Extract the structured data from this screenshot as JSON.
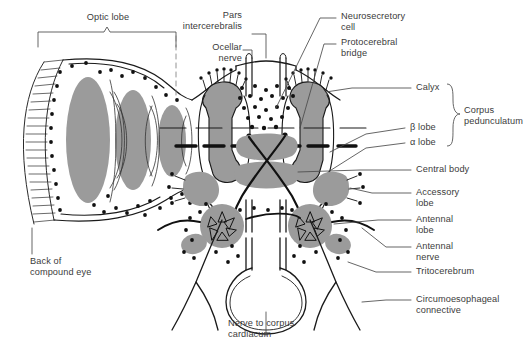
{
  "figure": {
    "background_color": "#ffffff",
    "outline_color": "#1a1a1a",
    "neuropil_fill": "#9b9b9b",
    "text_color": "#3b3b3b"
  },
  "labels": {
    "optic_lobe": "Optic lobe",
    "pars_intercerebralis": "Pars\nintercerebralis",
    "ocellar_nerve": "Ocellar\nnerve",
    "neurosecretory_cell": "Neurosecretory\ncell",
    "protocerebral_bridge": "Protocerebral\nbridge",
    "calyx": "Calyx",
    "corpus_pedunculatum": "Corpus\npedunculatum",
    "beta_lobe": "β lobe",
    "alpha_lobe": "α lobe",
    "central_body": "Central body",
    "accessory_lobe": "Accessory\nlobe",
    "antennal_lobe": "Antennal\nlobe",
    "antennal_nerve": "Antennal\nnerve",
    "tritocerebrum": "Tritocerebrum",
    "circumoesophageal_connective": "Circumoesophageal\nconnective",
    "back_of_compound_eye": "Back of\ncompound eye",
    "nerve_to_corpus_cardiacum": "Nerve to corpus\ncardiacum"
  }
}
